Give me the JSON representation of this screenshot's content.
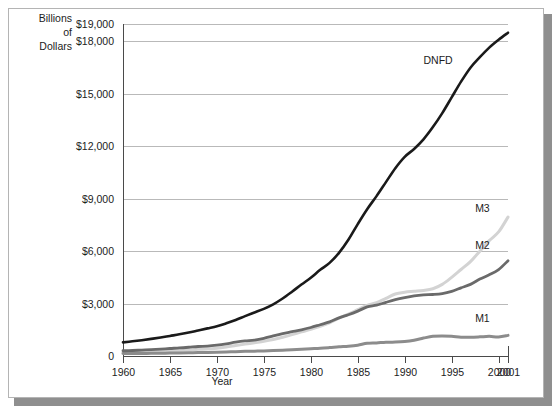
{
  "figure": {
    "y_axis_caption_lines": [
      "Billions",
      "of",
      "Dollars"
    ],
    "x_axis_title": "Year"
  },
  "chart_data": {
    "type": "line",
    "title": "",
    "subtitle": "",
    "xlabel": "Year",
    "ylabel": "Billions of Dollars",
    "xlim": [
      1960,
      2001
    ],
    "ylim": [
      0,
      19000
    ],
    "grid": true,
    "grid_axis": "y",
    "legend_position": "inline-right-end-labels",
    "x_tick_labels": [
      "1960",
      "1965",
      "1970",
      "1975",
      "1980",
      "1985",
      "1990",
      "1995",
      "2000",
      "2001"
    ],
    "x_ticks": [
      1960,
      1965,
      1970,
      1975,
      1980,
      1985,
      1990,
      1995,
      2000,
      2001
    ],
    "y_tick_labels": [
      "0",
      "$3,000",
      "$6,000",
      "$9,000",
      "$12,000",
      "$15,000",
      "$18,000",
      "$19,000"
    ],
    "y_ticks": [
      0,
      3000,
      6000,
      9000,
      12000,
      15000,
      18000,
      19000
    ],
    "x": [
      1960,
      1961,
      1962,
      1963,
      1964,
      1965,
      1966,
      1967,
      1968,
      1969,
      1970,
      1971,
      1972,
      1973,
      1974,
      1975,
      1976,
      1977,
      1978,
      1979,
      1980,
      1981,
      1982,
      1983,
      1984,
      1985,
      1986,
      1987,
      1988,
      1989,
      1990,
      1991,
      1992,
      1993,
      1994,
      1995,
      1996,
      1997,
      1998,
      1999,
      2000,
      2001
    ],
    "series": [
      {
        "name": "DNFD",
        "label": "DNFD",
        "color": "#1a1a1a",
        "linewidth": 2.6,
        "label_x": 1992.0,
        "label_y": 16700,
        "values": [
          780,
          840,
          905,
          980,
          1060,
          1150,
          1240,
          1340,
          1460,
          1580,
          1700,
          1870,
          2060,
          2280,
          2490,
          2700,
          2960,
          3290,
          3680,
          4090,
          4480,
          4930,
          5330,
          5900,
          6650,
          7550,
          8400,
          9150,
          9950,
          10750,
          11400,
          11850,
          12400,
          13100,
          13900,
          14800,
          15700,
          16500,
          17100,
          17650,
          18100,
          18500
        ]
      },
      {
        "name": "M3",
        "label": "M3",
        "color": "#d3d3d3",
        "linewidth": 3.0,
        "label_x": 1997.5,
        "label_y": 8250,
        "values": [
          200,
          210,
          225,
          245,
          265,
          290,
          310,
          345,
          385,
          400,
          450,
          520,
          600,
          680,
          760,
          840,
          940,
          1070,
          1220,
          1380,
          1530,
          1700,
          1900,
          2160,
          2400,
          2650,
          2900,
          3050,
          3300,
          3550,
          3650,
          3700,
          3750,
          3850,
          4100,
          4500,
          4950,
          5400,
          6000,
          6600,
          7100,
          7950
        ]
      },
      {
        "name": "M2",
        "label": "M2",
        "color": "#6a6a6a",
        "linewidth": 2.8,
        "label_x": 1997.5,
        "label_y": 6100,
        "values": [
          300,
          315,
          340,
          365,
          395,
          430,
          460,
          500,
          545,
          570,
          625,
          700,
          790,
          860,
          910,
          1010,
          1150,
          1280,
          1390,
          1500,
          1630,
          1790,
          1950,
          2180,
          2360,
          2570,
          2810,
          2910,
          3070,
          3220,
          3340,
          3440,
          3500,
          3520,
          3570,
          3700,
          3900,
          4100,
          4400,
          4650,
          4950,
          5450
        ]
      },
      {
        "name": "M1",
        "label": "M1",
        "color": "#8c8c8c",
        "linewidth": 3.0,
        "label_x": 1997.5,
        "label_y": 1950,
        "values": [
          140,
          143,
          147,
          153,
          160,
          168,
          172,
          183,
          197,
          204,
          215,
          230,
          250,
          265,
          278,
          290,
          310,
          335,
          363,
          389,
          415,
          440,
          480,
          525,
          560,
          620,
          725,
          750,
          790,
          795,
          825,
          900,
          1025,
          1130,
          1150,
          1130,
          1080,
          1075,
          1095,
          1125,
          1090,
          1180
        ]
      }
    ]
  }
}
